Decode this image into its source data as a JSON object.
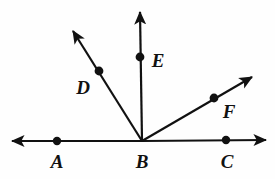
{
  "figure": {
    "kind": "geometry-ray-diagram",
    "width": 275,
    "height": 179,
    "background_color": "#fefefe",
    "stroke_color": "#111111",
    "dot_color": "#111111",
    "line_width": 2.2
  },
  "vertex": {
    "name": "B",
    "x": 142,
    "y": 141
  },
  "baseline": {
    "name": "line-AC",
    "y": 141,
    "left_arrow_tip_x": 12,
    "right_arrow_tip_x": 266,
    "double_headed": true
  },
  "rays": [
    {
      "id": "ray-BA",
      "from": "B",
      "through": "A",
      "tip_x": 12,
      "tip_y": 141,
      "arrow": true
    },
    {
      "id": "ray-BD",
      "from": "B",
      "through": "D",
      "tip_x": 73,
      "tip_y": 31,
      "arrow": true
    },
    {
      "id": "ray-BE",
      "from": "B",
      "through": "E",
      "tip_x": 140,
      "tip_y": 12,
      "arrow": true
    },
    {
      "id": "ray-BF",
      "from": "B",
      "through": "F",
      "tip_x": 252,
      "tip_y": 77,
      "arrow": true
    },
    {
      "id": "ray-BC",
      "from": "B",
      "through": "C",
      "tip_x": 266,
      "tip_y": 140,
      "arrow": true
    }
  ],
  "points": [
    {
      "label": "A",
      "dot_x": 57,
      "dot_y": 141,
      "label_x": 57,
      "label_y": 161,
      "dot_r": 4.2
    },
    {
      "label": "B",
      "dot_x": 142,
      "dot_y": 141,
      "label_x": 142,
      "label_y": 161,
      "dot_r": 0
    },
    {
      "label": "C",
      "dot_x": 226,
      "dot_y": 140,
      "label_x": 227,
      "label_y": 161,
      "dot_r": 4.2
    },
    {
      "label": "D",
      "dot_x": 99,
      "dot_y": 71,
      "label_x": 83,
      "label_y": 87,
      "dot_r": 4.4
    },
    {
      "label": "E",
      "dot_x": 140,
      "dot_y": 57,
      "label_x": 158,
      "label_y": 60,
      "dot_r": 4.4
    },
    {
      "label": "F",
      "dot_x": 214,
      "dot_y": 98,
      "label_x": 229,
      "label_y": 111,
      "dot_r": 4.4
    }
  ],
  "labels": {
    "A": "A",
    "B": "B",
    "C": "C",
    "D": "D",
    "E": "E",
    "F": "F"
  }
}
